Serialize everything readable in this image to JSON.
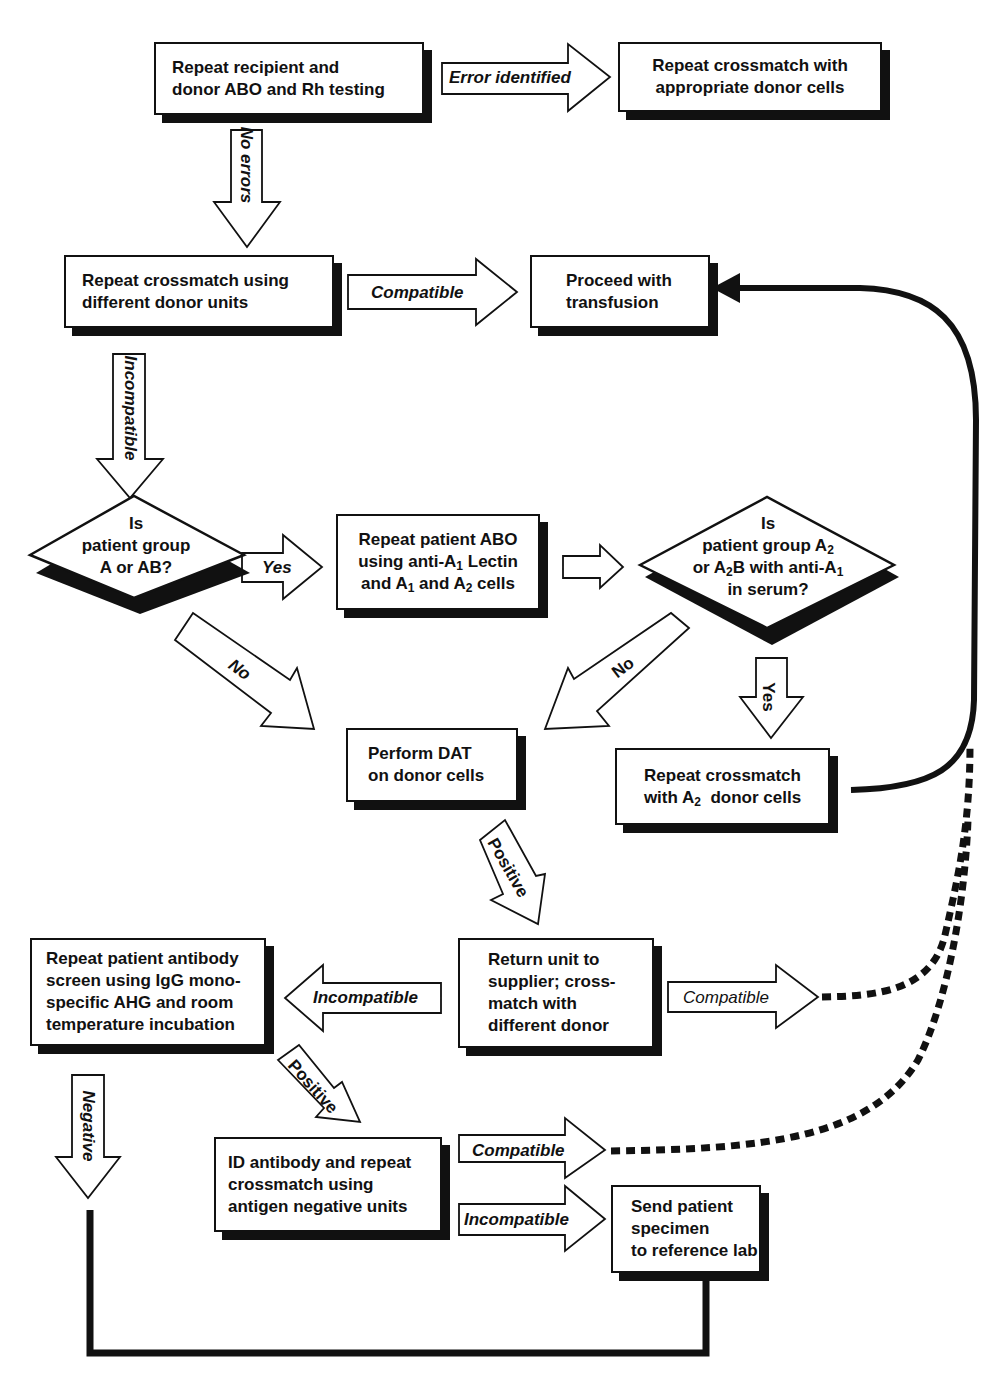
{
  "diagram": {
    "type": "flowchart"
  },
  "nodes": {
    "repeat_abo_rh": {
      "line1": "Repeat recipient and",
      "line2": "donor ABO and Rh testing"
    },
    "repeat_xm_appropriate": {
      "line1": "Repeat crossmatch with",
      "line2": "appropriate donor cells"
    },
    "repeat_xm_different_units": {
      "line1": "Repeat crossmatch using",
      "line2": "different donor units"
    },
    "proceed_transfusion": {
      "line1": "Proceed with",
      "line2": "transfusion"
    },
    "decision_group_a": {
      "line1": "Is",
      "line2": "patient group",
      "line3": "A or AB?"
    },
    "repeat_patient_abo": {
      "line1": "Repeat patient ABO",
      "line2a": "using anti-A",
      "line2sub": "1",
      "line2b": " Lectin",
      "line3a": "and A",
      "line3sub1": "1",
      "line3b": " and A",
      "line3sub2": "2",
      "line3c": " cells"
    },
    "decision_group_a2": {
      "line1": "Is",
      "line2a": "patient group A",
      "line2sub": "2",
      "line3a": "or A",
      "line3sub1": "2",
      "line3b": "B with anti-A",
      "line3sub2": "1",
      "line4": "in serum?"
    },
    "perform_dat": {
      "line1": "Perform DAT",
      "line2": "on donor cells"
    },
    "repeat_xm_a2": {
      "line1": "Repeat crossmatch",
      "line2a": "with A",
      "line2sub": "2",
      "line2b": "  donor cells"
    },
    "return_unit": {
      "line1": "Return unit to",
      "line2": "supplier; cross-",
      "line3": "match with",
      "line4": "different donor"
    },
    "repeat_antibody_screen": {
      "line1": "Repeat patient antibody",
      "line2": "screen using IgG mono-",
      "line3": "specific AHG and room",
      "line4": "temperature incubation"
    },
    "id_antibody": {
      "line1": "ID antibody and repeat",
      "line2": "crossmatch using",
      "line3": "antigen negative units"
    },
    "send_reference_lab": {
      "line1": "Send patient",
      "line2": "specimen",
      "line3": "to reference lab"
    }
  },
  "edges": {
    "error_identified": "Error identified",
    "no_errors": "No errors",
    "compatible_1": "Compatible",
    "incompatible_1": "Incompatible",
    "yes_1": "Yes",
    "no_1": "No",
    "no_2": "No",
    "yes_2": "Yes",
    "positive_1": "Positive",
    "incompatible_2": "Incompatible",
    "compatible_2": "Compatible",
    "positive_2": "Positive",
    "negative": "Negative",
    "compatible_3": "Compatible",
    "incompatible_3": "Incompatible"
  },
  "colors": {
    "line": "#111111",
    "fill": "#ffffff",
    "shadow": "#111111"
  }
}
